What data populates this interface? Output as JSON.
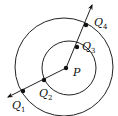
{
  "diagram": {
    "type": "geometry",
    "circles": [
      {
        "name": "outer-circle",
        "cx": 64,
        "cy": 67,
        "r": 49
      },
      {
        "name": "inner-circle",
        "cx": 69,
        "cy": 68,
        "r": 27
      }
    ],
    "center": {
      "label": "P",
      "x": 66,
      "y": 68,
      "label_x": 73,
      "label_y": 75
    },
    "points": [
      {
        "name": "Q",
        "sub": "1",
        "x": 23,
        "y": 91,
        "label_x": 13,
        "label_y": 108
      },
      {
        "name": "Q",
        "sub": "2",
        "x": 44,
        "y": 80,
        "label_x": 39,
        "label_y": 96
      },
      {
        "name": "Q",
        "sub": "3",
        "x": 77,
        "y": 47,
        "label_x": 82,
        "label_y": 49
      },
      {
        "name": "Q",
        "sub": "4",
        "x": 86,
        "y": 25,
        "label_x": 94,
        "label_y": 25
      }
    ],
    "ray": {
      "start": {
        "x": 8,
        "y": 97
      },
      "bend": {
        "x": 66,
        "y": 68
      },
      "end": {
        "x": 92,
        "y": 5
      }
    },
    "labels": {
      "P": "P",
      "Q": "Q",
      "Q1_sub": "1",
      "Q2_sub": "2",
      "Q3_sub": "3",
      "Q4_sub": "4"
    }
  }
}
